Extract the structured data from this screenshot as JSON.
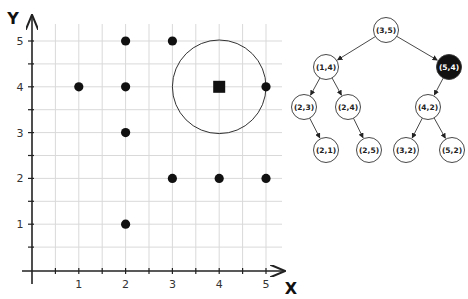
{
  "chart_data": {
    "type": "scatter",
    "title": "",
    "xlabel": "X",
    "ylabel": "Y",
    "xlim": [
      0,
      5.3
    ],
    "ylim": [
      0,
      5.4
    ],
    "x_ticks": [
      "1",
      "2",
      "3",
      "4",
      "5"
    ],
    "y_ticks": [
      "1",
      "2",
      "3",
      "4",
      "5"
    ],
    "grid": true,
    "grid_step": 0.5,
    "points": [
      {
        "x": 1,
        "y": 4
      },
      {
        "x": 2,
        "y": 5
      },
      {
        "x": 2,
        "y": 4
      },
      {
        "x": 2,
        "y": 3
      },
      {
        "x": 2,
        "y": 1
      },
      {
        "x": 3,
        "y": 5
      },
      {
        "x": 3,
        "y": 2
      },
      {
        "x": 4,
        "y": 2
      },
      {
        "x": 5,
        "y": 4
      },
      {
        "x": 5,
        "y": 2
      }
    ],
    "query_point": {
      "x": 4,
      "y": 4,
      "marker": "square"
    },
    "search_circle": {
      "cx": 4,
      "cy": 4,
      "r": 1
    }
  },
  "tree": {
    "nodes": [
      {
        "id": "n35",
        "label": "(3,5)",
        "highlighted": false
      },
      {
        "id": "n14",
        "label": "(1,4)",
        "highlighted": false
      },
      {
        "id": "n54",
        "label": "(5,4)",
        "highlighted": true
      },
      {
        "id": "n23",
        "label": "(2,3)",
        "highlighted": false
      },
      {
        "id": "n24",
        "label": "(2,4)",
        "highlighted": false
      },
      {
        "id": "n42",
        "label": "(4,2)",
        "highlighted": false
      },
      {
        "id": "n21",
        "label": "(2,1)",
        "highlighted": false
      },
      {
        "id": "n25",
        "label": "(2,5)",
        "highlighted": false
      },
      {
        "id": "n32",
        "label": "(3,2)",
        "highlighted": false
      },
      {
        "id": "n52",
        "label": "(5,2)",
        "highlighted": false
      }
    ],
    "edges": [
      [
        "n35",
        "n14"
      ],
      [
        "n35",
        "n54"
      ],
      [
        "n14",
        "n23"
      ],
      [
        "n14",
        "n24"
      ],
      [
        "n54",
        "n42"
      ],
      [
        "n23",
        "n21"
      ],
      [
        "n24",
        "n25"
      ],
      [
        "n42",
        "n32"
      ],
      [
        "n42",
        "n52"
      ]
    ]
  },
  "colors": {
    "grid": "#d9d9d9",
    "axis": "#222222",
    "point": "#111111",
    "highlight_node": "#111111"
  }
}
